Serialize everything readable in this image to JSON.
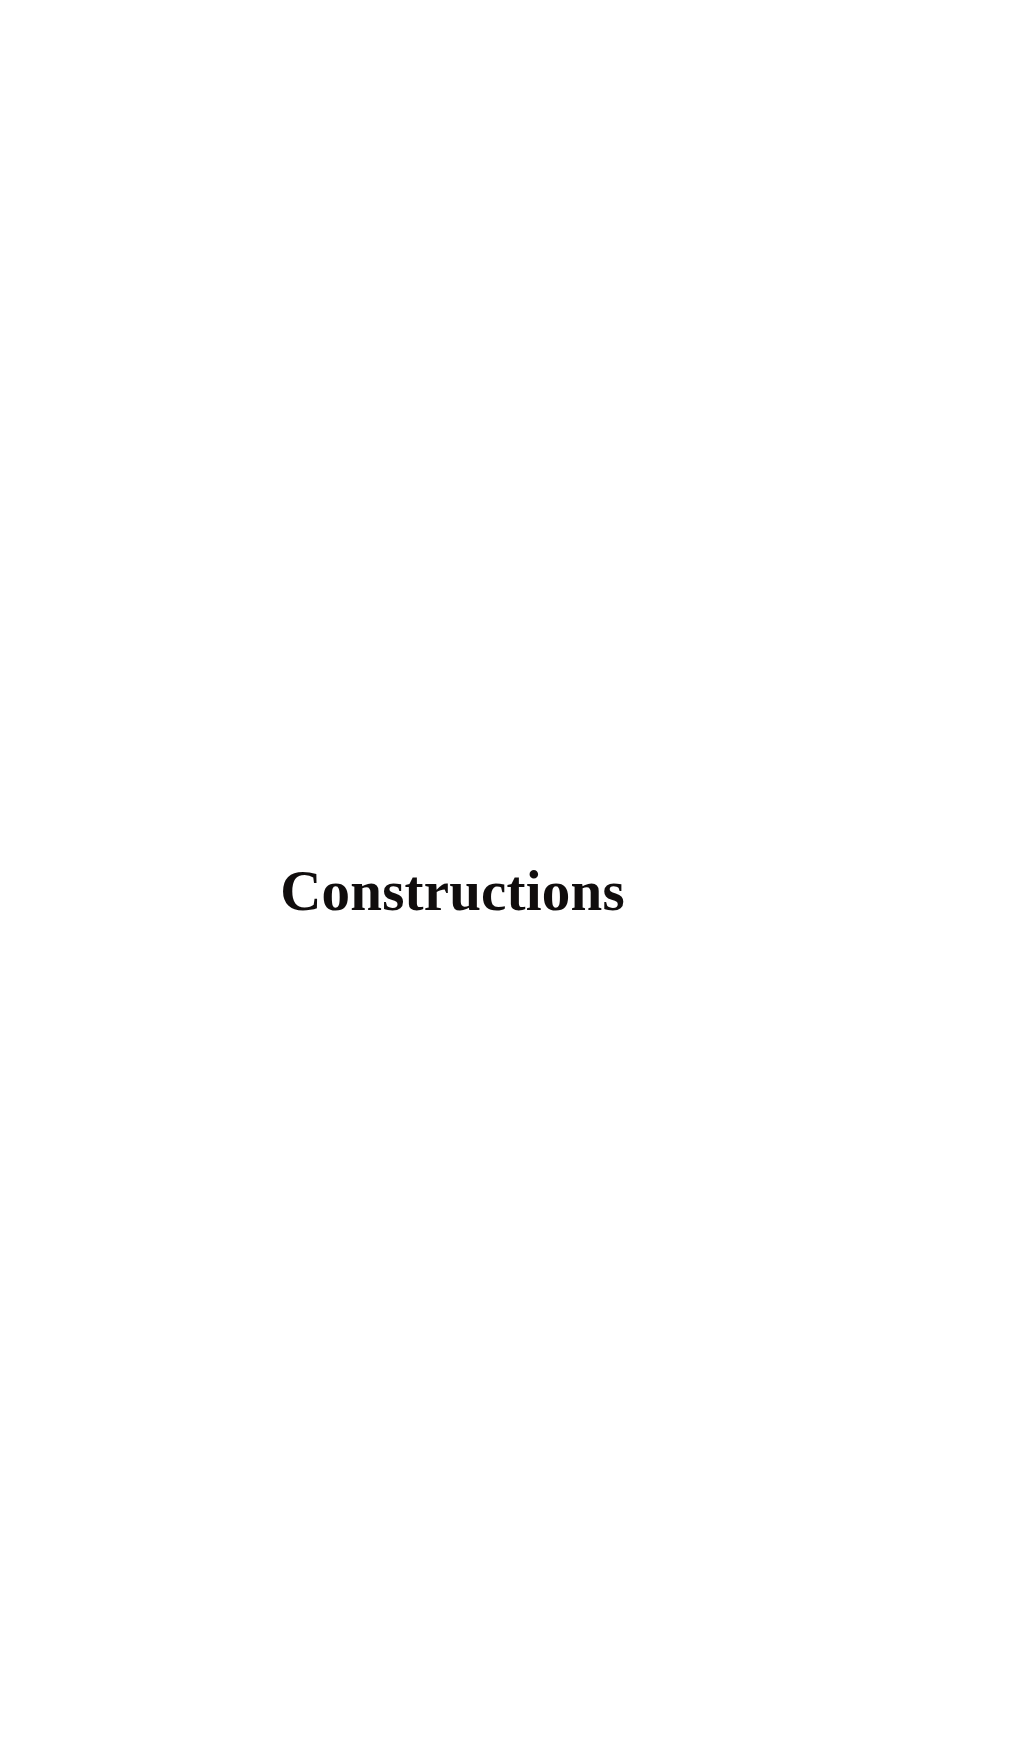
{
  "document": {
    "type": "book-section-divider-page",
    "background_color": "#ffffff",
    "text_color": "#100d0d",
    "page": {
      "width": 1011,
      "height": 1762
    }
  },
  "part_divider": {
    "title": "Constructions"
  }
}
